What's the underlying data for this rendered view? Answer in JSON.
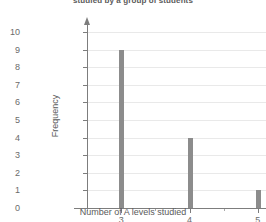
{
  "chart_data": {
    "type": "bar",
    "title": "studied by a group of students",
    "xlabel": "Number of A levels studied",
    "ylabel": "Frequency",
    "categories": [
      "3",
      "4",
      "5"
    ],
    "values": [
      9,
      4,
      1
    ],
    "x": [
      3,
      4,
      5
    ],
    "xlim": [
      2.5,
      5.5
    ],
    "ylim": [
      0,
      10
    ],
    "y_ticks": [
      "0",
      "1",
      "2",
      "3",
      "4",
      "5",
      "6",
      "7",
      "8",
      "9",
      "10"
    ],
    "y_tick_values": [
      0,
      1,
      2,
      3,
      4,
      5,
      6,
      7,
      8,
      9,
      10
    ],
    "x_ticks": [
      "3",
      "4",
      "5"
    ],
    "x_minor_ticks": [
      2.5,
      3.5,
      4.5
    ],
    "grid": true,
    "grid_axis": "y",
    "legend": null,
    "bar_color": "#8c8c8c",
    "grid_color": "#e9e9e9",
    "axis_color": "#7d7d7d",
    "text_color": "#6b6b6b",
    "background": "#ffffff"
  },
  "axes": {
    "y_arrow": "arrow-up-icon",
    "x_arrow": "arrow-right-icon"
  }
}
